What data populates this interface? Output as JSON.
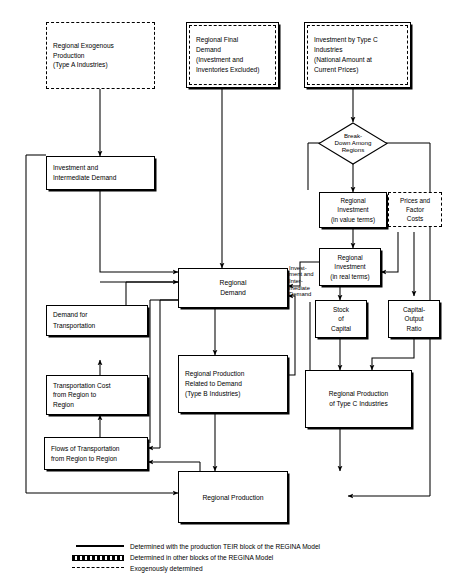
{
  "diagram": {
    "nodes": {
      "regional_exogenous_production": "Regional Exogenous\nProduction\n(Type A Industries)",
      "regional_final_demand": "Regional Final\nDemand\n(Investment and\nInventories Excluded)",
      "investment_type_c": "Investment by Type C\nIndustries\n(National Amount at\nCurrent Prices)",
      "break_down_among_regions": "Break-\nDown Among\nRegions",
      "investment_intermediate_demand": "Investment and\nIntermediate Demand",
      "regional_investment_value": "Regional\nInvestment\n(in value terms)",
      "prices_factor_costs": "Prices and\nFactor\nCosts",
      "regional_investment_real": "Regional\nInvestment\n(in real terms)",
      "demand_for_transportation": "Demand for\nTransportation",
      "regional_demand": "Regional\nDemand",
      "stock_of_capital": "Stock\nof\nCapital",
      "capital_output_ratio": "Capital-\nOutput\nRatio",
      "transportation_cost": "Transportation Cost\nfrom Region to\nRegion",
      "regional_production_type_b": "Regional Production\nRelated to Demand\n(Type B Industries)",
      "regional_production_type_c": "Regional Production\nof Type C Industries",
      "flows_of_transportation": "Flows of Transportation\nfrom Region to Region",
      "regional_production": "Regional Production"
    },
    "edge_labels": {
      "investment_intermediate": "Invest-\nment and\nInter-\nmediate\nDemand"
    },
    "legend": [
      {
        "key": "solid-line",
        "label": "Determined with the production TEIR block of the REGINA Model"
      },
      {
        "key": "double-line",
        "label": "Determined in other blocks of the REGINA Model"
      },
      {
        "key": "dashed-line",
        "label": "Exogenously determined"
      }
    ],
    "colors": {
      "line": "#000000",
      "background": "#ffffff",
      "text": "#000000"
    }
  }
}
